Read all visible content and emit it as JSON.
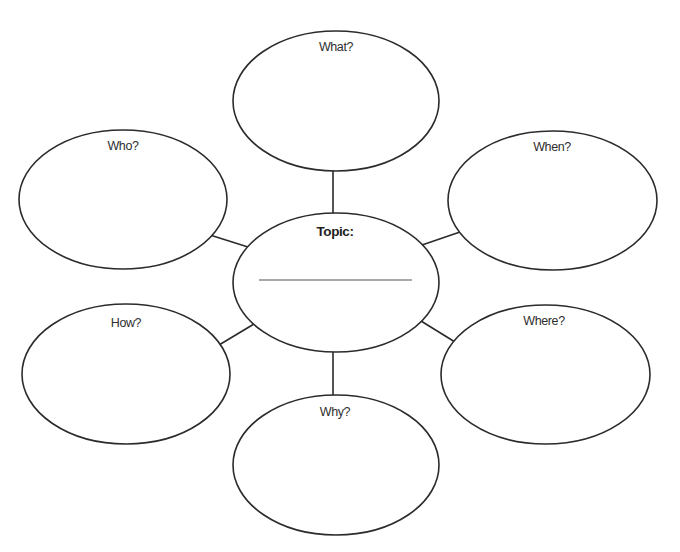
{
  "diagram": {
    "type": "concept-web",
    "center": {
      "id": "topic",
      "label": "Topic:",
      "has_write_in_line": true,
      "value": ""
    },
    "nodes": [
      {
        "id": "what",
        "label": "What?",
        "position": "top"
      },
      {
        "id": "who",
        "label": "Who?",
        "position": "upper-left"
      },
      {
        "id": "when",
        "label": "When?",
        "position": "upper-right"
      },
      {
        "id": "how",
        "label": "How?",
        "position": "lower-left"
      },
      {
        "id": "where",
        "label": "Where?",
        "position": "lower-right"
      },
      {
        "id": "why",
        "label": "Why?",
        "position": "bottom"
      }
    ],
    "edges": [
      {
        "from": "topic",
        "to": "what"
      },
      {
        "from": "topic",
        "to": "who"
      },
      {
        "from": "topic",
        "to": "when"
      },
      {
        "from": "topic",
        "to": "how"
      },
      {
        "from": "topic",
        "to": "where"
      },
      {
        "from": "topic",
        "to": "why"
      }
    ],
    "colors": {
      "stroke": "#2b2b2b",
      "text": "#2e2e2e",
      "background": "#ffffff"
    }
  }
}
